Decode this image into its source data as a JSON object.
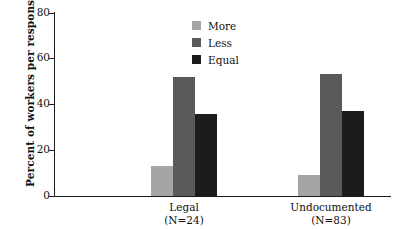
{
  "chart_data": {
    "type": "bar",
    "title": "",
    "xlabel": "",
    "ylabel": "Percent of workers per response",
    "ylim": [
      0,
      80
    ],
    "yticks": [
      0,
      20,
      40,
      60,
      80
    ],
    "ytick_labels": [
      "0",
      "20",
      "40",
      "60",
      "80"
    ],
    "grid": false,
    "legend_position": "top-center",
    "categories": [
      "Legal",
      "Undocumented"
    ],
    "category_sublabels": [
      "(N=24)",
      "(N=83)"
    ],
    "series": [
      {
        "name": "More",
        "color": "#a5a5a5",
        "values": [
          13,
          9
        ]
      },
      {
        "name": "Less",
        "color": "#5a5a5a",
        "values": [
          52,
          53
        ]
      },
      {
        "name": "Equal",
        "color": "#1c1c1c",
        "values": [
          35.5,
          37
        ]
      }
    ]
  },
  "axis": {
    "y_title": "Percent of workers per response",
    "tick_0": "0",
    "tick_20": "20",
    "tick_40": "40",
    "tick_60": "60",
    "tick_80": "80"
  },
  "legend": {
    "items": [
      {
        "label": "More"
      },
      {
        "label": "Less"
      },
      {
        "label": "Equal"
      }
    ]
  },
  "categories": [
    {
      "name": "Legal",
      "n": "(N=24)"
    },
    {
      "name": "Undocumented",
      "n": "(N=83)"
    }
  ]
}
